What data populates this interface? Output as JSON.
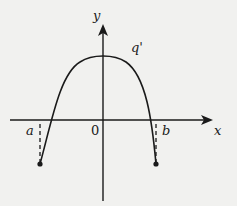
{
  "diagram": {
    "type": "function-graph",
    "axes": {
      "x_label": "x",
      "y_label": "y",
      "origin_label": "0"
    },
    "curve": {
      "label": "q'",
      "shape": "downward parabola",
      "endpoints": [
        "a",
        "b"
      ]
    },
    "points": {
      "a_label": "a",
      "b_label": "b"
    },
    "colors": {
      "ink": "#1a1a1a",
      "background": "#f1f1ef"
    }
  }
}
